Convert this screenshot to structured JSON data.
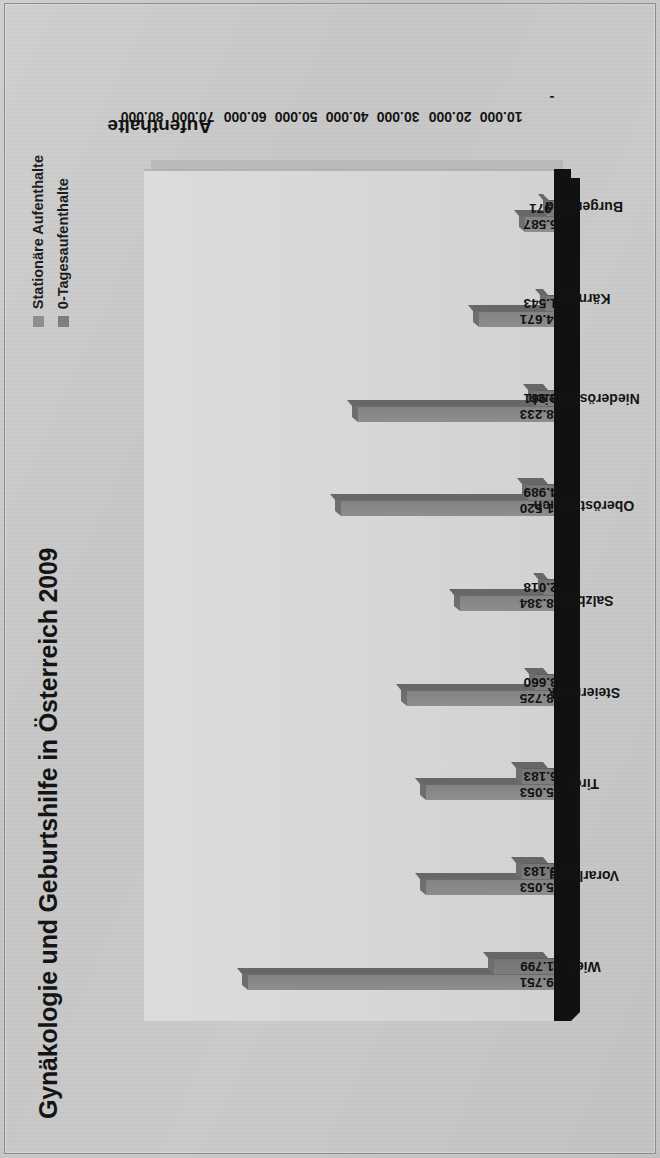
{
  "chart_data": {
    "type": "bar",
    "orientation": "vertical-rotated",
    "title": "Gynäkologie und Geburtshilfe in Österreich 2009",
    "xlabel": "",
    "ylabel": "Aufenthalte",
    "ylim": [
      0,
      80000
    ],
    "grid": false,
    "legend_position": "top-right",
    "tick_labels": [
      "-",
      "10.000",
      "20.000",
      "30.000",
      "40.000",
      "50.000",
      "60.000",
      "70.000",
      "80.000"
    ],
    "tick_values": [
      0,
      10000,
      20000,
      30000,
      40000,
      50000,
      60000,
      70000,
      80000
    ],
    "categories": [
      "Wien",
      "Vorarlberg",
      "Tirol",
      "Steiermark",
      "Salzburg",
      "Oberösterreich",
      "Niederösterreich",
      "Kärnten",
      "Burgenland"
    ],
    "series": [
      {
        "name": "Stationäre Aufenthalte",
        "color": "#8e8e8e",
        "values": [
          59751,
          25053,
          25053,
          28725,
          18384,
          41520,
          38233,
          14671,
          5587
        ],
        "labels": [
          "59.751",
          "25.053",
          "25.053",
          "28.725",
          "18.384",
          "41.520",
          "38.233",
          "14.671",
          "5.587"
        ]
      },
      {
        "name": "0-Tagesaufenthalte",
        "color": "#7e7e7e",
        "values": [
          11799,
          6183,
          6183,
          3660,
          2018,
          4989,
          3961,
          1543,
          971
        ],
        "labels": [
          "11.799",
          "6.183",
          "6.183",
          "3.660",
          "2.018",
          "4.989",
          "3.961",
          "1.543",
          "971"
        ]
      }
    ]
  }
}
